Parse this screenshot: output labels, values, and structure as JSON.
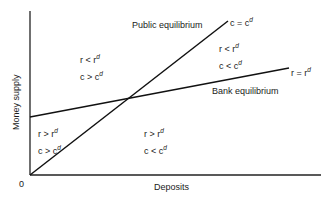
{
  "diagram": {
    "axes": {
      "x_label": "Deposits",
      "y_label": "Money supply",
      "origin_label": "0"
    },
    "lines": [
      {
        "name": "Public equilibrium",
        "end_label": "c = c",
        "end_label_sup": "d"
      },
      {
        "name": "Bank equilibrium",
        "end_label": "r = r",
        "end_label_sup": "d"
      }
    ],
    "regions": [
      {
        "position": "upper-left",
        "line1": "r < r",
        "line1_sup": "d",
        "line2": "c > c",
        "line2_sup": "d"
      },
      {
        "position": "upper-right",
        "line1": "r < r",
        "line1_sup": "d",
        "line2": "c < c",
        "line2_sup": "d"
      },
      {
        "position": "lower-left",
        "line1": "r > r",
        "line1_sup": "d",
        "line2": "c > c",
        "line2_sup": "d"
      },
      {
        "position": "lower-right",
        "line1": "r > r",
        "line1_sup": "d",
        "line2": "c < c",
        "line2_sup": "d"
      }
    ]
  }
}
